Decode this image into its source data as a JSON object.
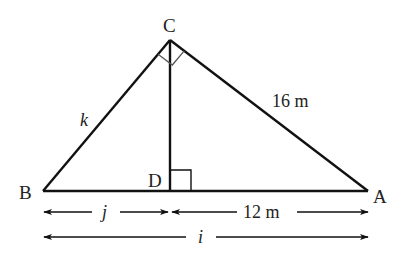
{
  "diagram": {
    "type": "right-triangle-altitude",
    "colors": {
      "stroke": "#111111",
      "text": "#222222",
      "background": "#ffffff"
    },
    "points": {
      "C": {
        "label": "C",
        "x": 170,
        "y": 40
      },
      "B": {
        "label": "B",
        "x": 43,
        "y": 191
      },
      "A": {
        "label": "A",
        "x": 368,
        "y": 191
      },
      "D": {
        "label": "D",
        "x": 170,
        "y": 191
      }
    },
    "side_labels": {
      "BC": "k",
      "CA": "16 m"
    },
    "dimensions": {
      "BD": "j",
      "DA": "12 m",
      "BA": "i"
    },
    "right_angles": [
      "C",
      "D"
    ]
  }
}
